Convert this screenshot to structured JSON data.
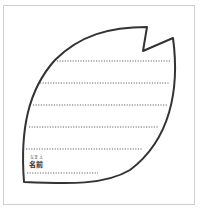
{
  "worksheet": {
    "shape": "sakura-petal",
    "ruled_lines": 6,
    "name_field": {
      "furigana": "なまえ",
      "label": "名前"
    }
  },
  "colors": {
    "outline": "#333333",
    "dots": "#666666",
    "frame": "#cfcfcf"
  }
}
